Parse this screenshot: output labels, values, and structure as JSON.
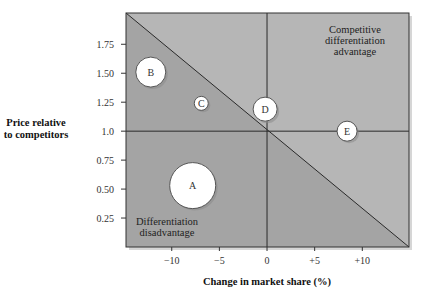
{
  "chart_data": {
    "type": "scatter",
    "subtype": "bubble",
    "title": "",
    "xlabel": "Change in market share (%)",
    "ylabel": "Price relative to competitors",
    "ylabel_lines": [
      "Price relative",
      "to competitors"
    ],
    "xlim": [
      -14.8,
      14.9
    ],
    "ylim": [
      0,
      2.02
    ],
    "x_ticks": [
      -10,
      -5,
      0,
      5,
      10
    ],
    "x_tick_labels": [
      "−10",
      "−5",
      "0",
      "+5",
      "+10"
    ],
    "y_ticks": [
      0.25,
      0.5,
      0.75,
      1.0,
      1.25,
      1.5,
      1.75
    ],
    "y_tick_labels": [
      "0.25",
      "0.50",
      "0.75",
      "1.0",
      "1.25",
      "1.50",
      "1.75"
    ],
    "reference_lines": {
      "x": 0,
      "y": 1.0
    },
    "diagonal": {
      "from": [
        -14.8,
        2.02
      ],
      "to": [
        14.9,
        0
      ]
    },
    "grid": false,
    "legend": null,
    "series": [
      {
        "name": "A",
        "x": -7.8,
        "y": 0.53,
        "size": 23
      },
      {
        "name": "B",
        "x": -12.2,
        "y": 1.51,
        "size": 15
      },
      {
        "name": "C",
        "x": -6.9,
        "y": 1.24,
        "size": 7
      },
      {
        "name": "D",
        "x": -0.2,
        "y": 1.19,
        "size": 12
      },
      {
        "name": "E",
        "x": 8.4,
        "y": 1.0,
        "size": 10
      }
    ],
    "annotations": [
      {
        "text_lines": [
          "Competitive",
          "differentiation",
          "advantage"
        ],
        "region": "upper-right"
      },
      {
        "text_lines": [
          "Differentiation",
          "disadvantage"
        ],
        "region": "lower-left"
      }
    ]
  },
  "colors": {
    "region_light": "#b6b6b6",
    "region_dark": "#a4a4a4",
    "line": "#2a2a2a",
    "bubble_fill": "#ffffff",
    "bubble_stroke": "#555555",
    "shadow": "#8a8a8a"
  }
}
